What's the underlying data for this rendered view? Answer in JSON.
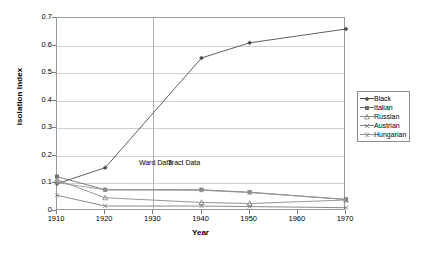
{
  "chart_data": {
    "type": "line",
    "title": "",
    "xlabel": "Year",
    "ylabel": "Isolation Index",
    "x": [
      1910,
      1920,
      1930,
      1940,
      1950,
      1960,
      1970
    ],
    "xlim": [
      1910,
      1970
    ],
    "ylim": [
      0,
      0.7
    ],
    "xticks": [
      "1910",
      "1920",
      "1930",
      "1940",
      "1950",
      "1960",
      "1970"
    ],
    "yticks": [
      "0",
      "0.1",
      "0.2",
      "0.3",
      "0.4",
      "0.5",
      "0.6",
      "0.7"
    ],
    "grid": "horizontal",
    "legend_position": "right",
    "series": [
      {
        "name": "Black",
        "color": "#4d4d4d",
        "marker": "diamond",
        "x": [
          1910,
          1920,
          1940,
          1950,
          1970
        ],
        "values": [
          0.099,
          0.157,
          0.555,
          0.61,
          0.66
        ]
      },
      {
        "name": "Italian",
        "color": "#6e6e6e",
        "marker": "square",
        "x": [
          1910,
          1920,
          1940,
          1950,
          1970
        ],
        "values": [
          0.125,
          0.077,
          0.077,
          0.068,
          0.042
        ]
      },
      {
        "name": "Russian",
        "color": "#8a8a8a",
        "marker": "triangle",
        "x": [
          1910,
          1920,
          1940,
          1950,
          1970
        ],
        "values": [
          0.113,
          0.048,
          0.031,
          0.027,
          0.04
        ]
      },
      {
        "name": "Austrian",
        "color": "#7d7d7d",
        "marker": "cross",
        "x": [
          1910,
          1920,
          1940,
          1950,
          1970
        ],
        "values": [
          0.057,
          0.018,
          0.018,
          0.016,
          0.012
        ]
      },
      {
        "name": "Hungarian",
        "color": "#949494",
        "marker": "asterisk",
        "x": [
          1910,
          1920,
          1940,
          1950,
          1970
        ],
        "values": [
          0.103,
          0.077,
          0.075,
          0.067,
          0.042
        ]
      }
    ],
    "annotations": [
      {
        "text": "Ward Data",
        "x": 1927,
        "y": 0.175
      },
      {
        "text": "Tract Data",
        "x": 1933,
        "y": 0.175
      }
    ],
    "divider": {
      "x": 1930,
      "label": "data-source-divider"
    }
  }
}
